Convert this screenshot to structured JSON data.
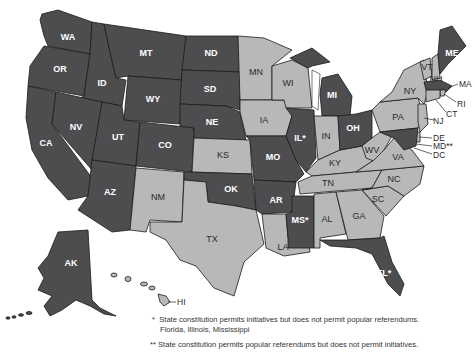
{
  "map": {
    "title": "",
    "legend_colors": {
      "dark": "#4d4d50",
      "light": "#b8b8b8"
    },
    "states": {
      "WA": {
        "label": "WA",
        "shade": "dark"
      },
      "OR": {
        "label": "OR",
        "shade": "dark"
      },
      "CA": {
        "label": "CA",
        "shade": "dark"
      },
      "ID": {
        "label": "ID",
        "shade": "dark"
      },
      "NV": {
        "label": "NV",
        "shade": "dark"
      },
      "MT": {
        "label": "MT",
        "shade": "dark"
      },
      "WY": {
        "label": "WY",
        "shade": "dark"
      },
      "UT": {
        "label": "UT",
        "shade": "dark"
      },
      "AZ": {
        "label": "AZ",
        "shade": "dark"
      },
      "CO": {
        "label": "CO",
        "shade": "dark"
      },
      "NM": {
        "label": "NM",
        "shade": "light"
      },
      "ND": {
        "label": "ND",
        "shade": "dark"
      },
      "SD": {
        "label": "SD",
        "shade": "dark"
      },
      "NE": {
        "label": "NE",
        "shade": "dark"
      },
      "KS": {
        "label": "KS",
        "shade": "light"
      },
      "OK": {
        "label": "OK",
        "shade": "dark"
      },
      "TX": {
        "label": "TX",
        "shade": "light"
      },
      "MN": {
        "label": "MN",
        "shade": "light"
      },
      "IA": {
        "label": "IA",
        "shade": "light"
      },
      "MO": {
        "label": "MO",
        "shade": "dark"
      },
      "AR": {
        "label": "AR",
        "shade": "dark"
      },
      "LA": {
        "label": "LA",
        "shade": "light"
      },
      "WI": {
        "label": "WI",
        "shade": "light"
      },
      "IL": {
        "label": "IL*",
        "shade": "dark"
      },
      "MS": {
        "label": "MS*",
        "shade": "dark"
      },
      "MI": {
        "label": "MI",
        "shade": "dark"
      },
      "IN": {
        "label": "IN",
        "shade": "light"
      },
      "KY": {
        "label": "KY",
        "shade": "light"
      },
      "TN": {
        "label": "TN",
        "shade": "light"
      },
      "AL": {
        "label": "AL",
        "shade": "light"
      },
      "OH": {
        "label": "OH",
        "shade": "dark"
      },
      "WV": {
        "label": "WV",
        "shade": "light"
      },
      "GA": {
        "label": "GA",
        "shade": "light"
      },
      "FL": {
        "label": "FL*",
        "shade": "dark"
      },
      "SC": {
        "label": "SC",
        "shade": "light"
      },
      "NC": {
        "label": "NC",
        "shade": "light"
      },
      "VA": {
        "label": "VA",
        "shade": "light"
      },
      "PA": {
        "label": "PA",
        "shade": "light"
      },
      "NY": {
        "label": "NY",
        "shade": "light"
      },
      "VT": {
        "label": "VT",
        "shade": "light"
      },
      "NH": {
        "label": "NH",
        "shade": "light"
      },
      "ME": {
        "label": "ME",
        "shade": "dark"
      },
      "MA": {
        "label": "MA",
        "shade": "dark"
      },
      "RI": {
        "label": "RI",
        "shade": "light"
      },
      "CT": {
        "label": "CT",
        "shade": "light"
      },
      "NJ": {
        "label": "NJ",
        "shade": "light"
      },
      "DE": {
        "label": "DE",
        "shade": "light"
      },
      "MD": {
        "label": "MD**",
        "shade": "dark"
      },
      "DC": {
        "label": "DC",
        "shade": "light"
      },
      "AK": {
        "label": "AK",
        "shade": "dark"
      },
      "HI": {
        "label": "HI",
        "shade": "light"
      }
    }
  },
  "footnotes": {
    "single_star_marker": "*",
    "single_star_text": "State constitution permits initiatives but does not permit popular referendums.",
    "single_star_states": "Florida, Illinois, Mississippi",
    "double_star_marker": "**",
    "double_star_text": "State constitution permits popular referendums but does not permit initiatives."
  }
}
